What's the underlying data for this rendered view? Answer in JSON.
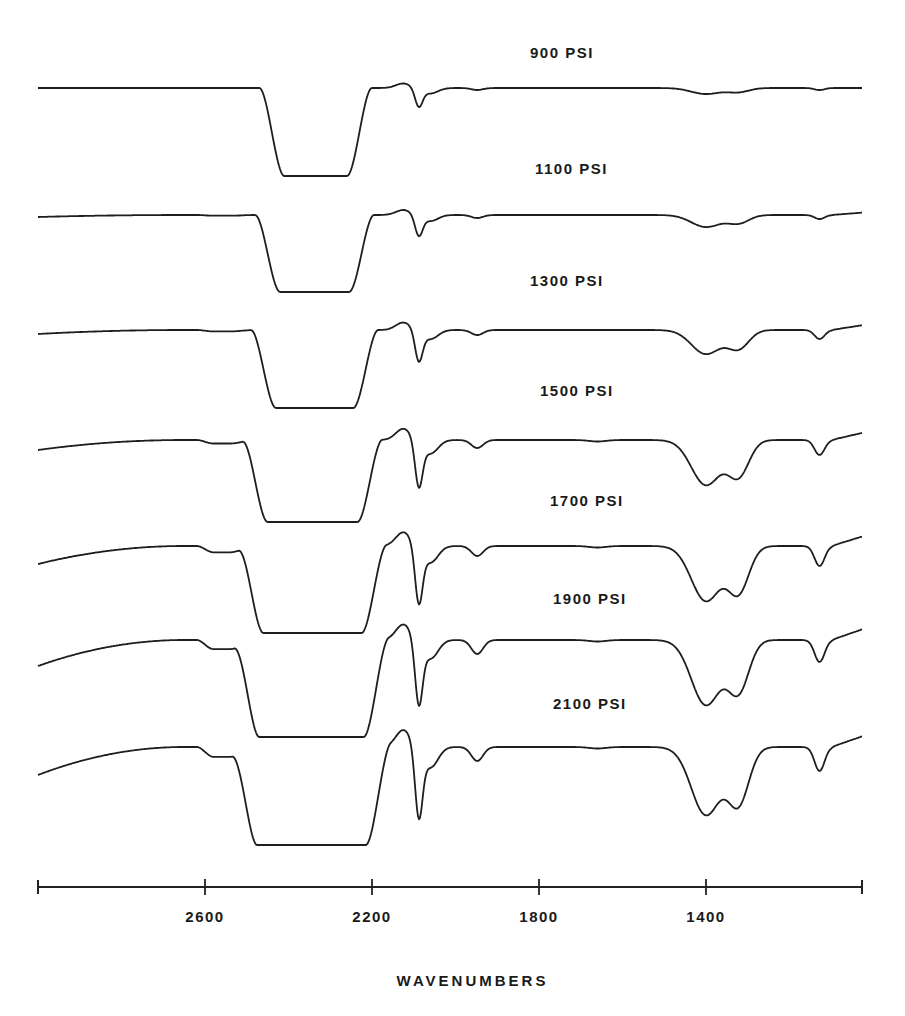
{
  "chart_data": {
    "type": "line",
    "title": "",
    "xlabel": "WAVENUMBERS",
    "ylabel": "",
    "x_axis": {
      "reversed": true,
      "range": [
        3000,
        1025
      ],
      "ticks": [
        2600,
        2200,
        1800,
        1400
      ],
      "tick_labels": [
        "2600",
        "2200",
        "1800",
        "1400"
      ]
    },
    "grid": false,
    "legend": "inline labels above each trace",
    "series": [
      {
        "name": "900 PSI",
        "label_pos": [
          530,
          52
        ],
        "baseline_y": 88,
        "bottom_y": 176,
        "sat_range": [
          2440,
          2230
        ],
        "band_2090_depth": 18,
        "band_1950_depth": 2,
        "band_1400_depth": 6,
        "band_1330_depth": 4,
        "band_1130_depth": 2,
        "left_droop": 0,
        "right_rise": 0
      },
      {
        "name": "1100 PSI",
        "label_pos": [
          535,
          168
        ],
        "baseline_y": 215,
        "bottom_y": 292,
        "sat_range": [
          2450,
          2225
        ],
        "band_2090_depth": 20,
        "band_1950_depth": 3,
        "band_1400_depth": 12,
        "band_1330_depth": 8,
        "band_1130_depth": 4,
        "left_droop": 2,
        "right_rise": 4
      },
      {
        "name": "1300 PSI",
        "label_pos": [
          530,
          280
        ],
        "baseline_y": 330,
        "bottom_y": 408,
        "sat_range": [
          2460,
          2215
        ],
        "band_2090_depth": 30,
        "band_1950_depth": 5,
        "band_1400_depth": 24,
        "band_1330_depth": 18,
        "band_1130_depth": 9,
        "left_droop": 4,
        "right_rise": 8
      },
      {
        "name": "1500 PSI",
        "label_pos": [
          540,
          390
        ],
        "baseline_y": 440,
        "bottom_y": 522,
        "sat_range": [
          2480,
          2205
        ],
        "band_2090_depth": 45,
        "band_1950_depth": 8,
        "band_1400_depth": 45,
        "band_1330_depth": 35,
        "band_1130_depth": 15,
        "left_droop": 10,
        "right_rise": 12
      },
      {
        "name": "1700 PSI",
        "label_pos": [
          550,
          500
        ],
        "baseline_y": 546,
        "bottom_y": 633,
        "sat_range": [
          2490,
          2195
        ],
        "band_2090_depth": 55,
        "band_1950_depth": 10,
        "band_1400_depth": 55,
        "band_1330_depth": 45,
        "band_1130_depth": 20,
        "left_droop": 18,
        "right_rise": 16
      },
      {
        "name": "1900 PSI",
        "label_pos": [
          553,
          598
        ],
        "baseline_y": 640,
        "bottom_y": 737,
        "sat_range": [
          2500,
          2190
        ],
        "band_2090_depth": 62,
        "band_1950_depth": 14,
        "band_1400_depth": 65,
        "band_1330_depth": 50,
        "band_1130_depth": 22,
        "left_droop": 26,
        "right_rise": 18
      },
      {
        "name": "2100 PSI",
        "label_pos": [
          553,
          703
        ],
        "baseline_y": 747,
        "bottom_y": 845,
        "sat_range": [
          2505,
          2185
        ],
        "band_2090_depth": 68,
        "band_1950_depth": 14,
        "band_1400_depth": 68,
        "band_1330_depth": 55,
        "band_1130_depth": 24,
        "left_droop": 28,
        "right_rise": 18
      }
    ],
    "annotations": []
  },
  "axis_geom": {
    "x_left": 38,
    "x_right": 862,
    "y": 887,
    "wn_left": 3000,
    "px_per_wn": 0.4175
  }
}
